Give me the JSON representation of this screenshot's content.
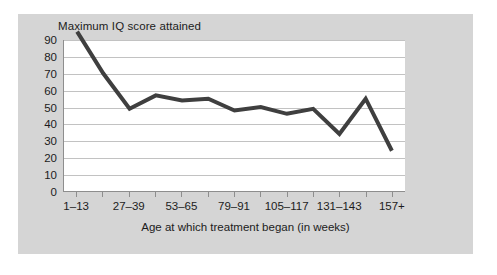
{
  "chart_data": {
    "type": "line",
    "title": "Maximum IQ score attained",
    "xlabel": "Age at which treatment began (in weeks)",
    "ylabel": "",
    "ylim": [
      0,
      90
    ],
    "ytick_labels": [
      "0",
      "10",
      "20",
      "30",
      "40",
      "50",
      "60",
      "70",
      "80",
      "90"
    ],
    "ytick_values": [
      0,
      10,
      20,
      30,
      40,
      50,
      60,
      70,
      80,
      90
    ],
    "grid": true,
    "legend": "none",
    "xtick_labels": [
      "1–13",
      "27–39",
      "53–65",
      "79–91",
      "105–117",
      "131–143",
      "157+"
    ],
    "categories": [
      "1–13",
      "14–26",
      "27–39",
      "40–52",
      "53–65",
      "66–78",
      "79–91",
      "92–104",
      "105–117",
      "118–130",
      "131–143",
      "144–156",
      "157+"
    ],
    "values": [
      95,
      70,
      49,
      57,
      54,
      55,
      48,
      50,
      46,
      49,
      34,
      55,
      24
    ],
    "line_color": "#3f3f3f",
    "line_width": 4,
    "plot_background": "#ffffff",
    "figure_background": "#d5d5d5",
    "gridline_color": "#c2c2c2",
    "axis_color": "#8e8e8e",
    "text_color": "#1c1c1c"
  }
}
